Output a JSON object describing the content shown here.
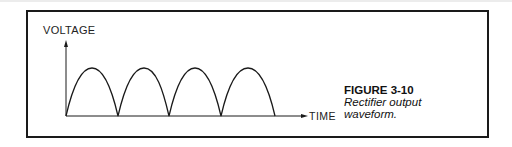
{
  "figure": {
    "number": "FIGURE 3-10",
    "caption_line1": "Rectifier output",
    "caption_line2": "waveform."
  },
  "axes": {
    "y_label": "VOLTAGE",
    "x_label": "TIME"
  },
  "waveform": {
    "type": "full-wave rectified sine",
    "cycles_shown": 4,
    "stroke_color": "#1a1a1a"
  }
}
